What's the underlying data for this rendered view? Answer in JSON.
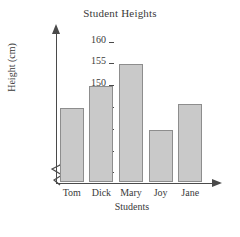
{
  "chart_data": {
    "type": "bar",
    "title": "Student Heights",
    "xlabel": "Students",
    "ylabel": "Height (cm)",
    "categories": [
      "Tom",
      "Dick",
      "Mary",
      "Joy",
      "Jane"
    ],
    "values": [
      145,
      150,
      155,
      140,
      146
    ],
    "ylim": [
      128,
      162
    ],
    "y_ticks": [
      130,
      135,
      140,
      145,
      150,
      155,
      160
    ],
    "y_axis_break": true,
    "grid": false,
    "legend": null,
    "bar_color": "#c9c9c9",
    "bar_border_color": "#8d8d8d",
    "axis_color": "#4a4a4a"
  }
}
